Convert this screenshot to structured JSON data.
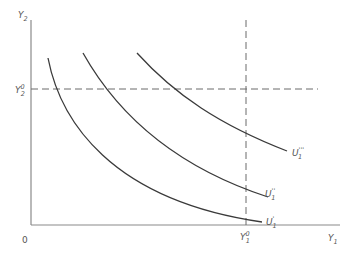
{
  "diagram": {
    "title": "",
    "axes": {
      "x_label": "Y",
      "x_label_sub": "1",
      "y_label": "Y",
      "y_label_sub": "2",
      "origin_label": "0"
    },
    "reference_lines": {
      "vertical": {
        "label": "Y",
        "label_sub": "1",
        "label_sup": "0"
      },
      "horizontal": {
        "label": "Y",
        "label_sub": "2",
        "label_sup": "0"
      }
    },
    "curves": [
      {
        "id": "u1-prime",
        "label": "U",
        "label_sub": "1",
        "label_sup": "'"
      },
      {
        "id": "u1-double-prime",
        "label": "U",
        "label_sub": "1",
        "label_sup": "''"
      },
      {
        "id": "u1-triple-prime",
        "label": "U",
        "label_sub": "1",
        "label_sup": "'''"
      }
    ]
  }
}
